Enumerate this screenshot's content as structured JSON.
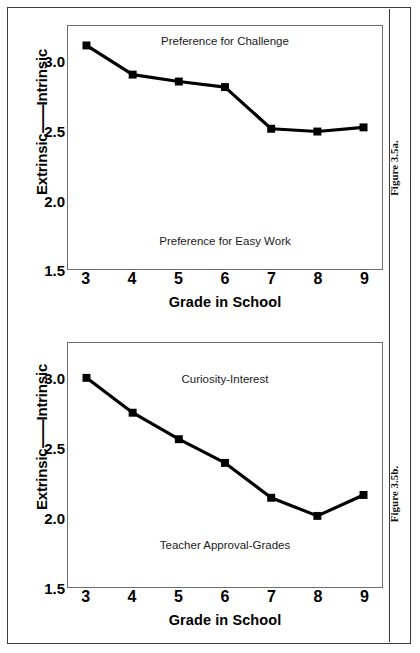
{
  "figure": {
    "panels": [
      {
        "id": "a",
        "caption": "Figure 3.5a.",
        "y_axis_title_left": "Extrinsic",
        "y_axis_title_dashes": "--------",
        "y_axis_title_right": "Intrinsic",
        "x_axis_title": "Grade in School",
        "label_top": "Preference for Challenge",
        "label_bottom": "Preference for Easy Work",
        "yticks": [
          "3.0",
          "2.5",
          "2.0",
          "1.5"
        ],
        "xticks": [
          "3",
          "4",
          "5",
          "6",
          "7",
          "8",
          "9"
        ]
      },
      {
        "id": "b",
        "caption": "Figure 3.5b.",
        "y_axis_title_left": "Extrinsic",
        "y_axis_title_dashes": "--------",
        "y_axis_title_right": "Intrinsic",
        "x_axis_title": "Grade in School",
        "label_top": "Curiosity-Interest",
        "label_bottom": "Teacher Approval-Grades",
        "yticks": [
          "3.0",
          "2.5",
          "2.0",
          "1.5"
        ],
        "xticks": [
          "3",
          "4",
          "5",
          "6",
          "7",
          "8",
          "9"
        ]
      }
    ]
  },
  "chart_data": [
    {
      "type": "line",
      "title": "Figure 3.5a.",
      "xlabel": "Grade in School",
      "ylabel": "Extrinsic--------Intrinsic",
      "categories": [
        3,
        4,
        5,
        6,
        7,
        8,
        9
      ],
      "values": [
        3.11,
        2.9,
        2.85,
        2.81,
        2.51,
        2.49,
        2.52
      ],
      "series": [
        {
          "name": "Preference for Challenge vs. Easy Work",
          "values": [
            3.11,
            2.9,
            2.85,
            2.81,
            2.51,
            2.49,
            2.52
          ]
        }
      ],
      "xlim": [
        2.6,
        9.4
      ],
      "ylim": [
        1.5,
        3.25
      ],
      "yticks": [
        1.5,
        2.0,
        2.5,
        3.0
      ],
      "xticks": [
        3,
        4,
        5,
        6,
        7,
        8,
        9
      ],
      "grid": false,
      "legend": "none",
      "annotations": [
        {
          "text": "Preference for Challenge",
          "position": "top-center"
        },
        {
          "text": "Preference for Easy Work",
          "position": "bottom-center"
        }
      ],
      "marker": "square",
      "color": "#000000"
    },
    {
      "type": "line",
      "title": "Figure 3.5b.",
      "xlabel": "Grade in School",
      "ylabel": "Extrinsic--------Intrinsic",
      "categories": [
        3,
        4,
        5,
        6,
        7,
        8,
        9
      ],
      "values": [
        3.0,
        2.75,
        2.56,
        2.39,
        2.14,
        2.01,
        2.16
      ],
      "series": [
        {
          "name": "Curiosity-Interest vs. Teacher Approval-Grades",
          "values": [
            3.0,
            2.75,
            2.56,
            2.39,
            2.14,
            2.01,
            2.16
          ]
        }
      ],
      "xlim": [
        2.6,
        9.4
      ],
      "ylim": [
        1.5,
        3.25
      ],
      "yticks": [
        1.5,
        2.0,
        2.5,
        3.0
      ],
      "xticks": [
        3,
        4,
        5,
        6,
        7,
        8,
        9
      ],
      "grid": false,
      "legend": "none",
      "annotations": [
        {
          "text": "Curiosity-Interest",
          "position": "top-center"
        },
        {
          "text": "Teacher Approval-Grades",
          "position": "bottom-center"
        }
      ],
      "marker": "square",
      "color": "#000000"
    }
  ]
}
